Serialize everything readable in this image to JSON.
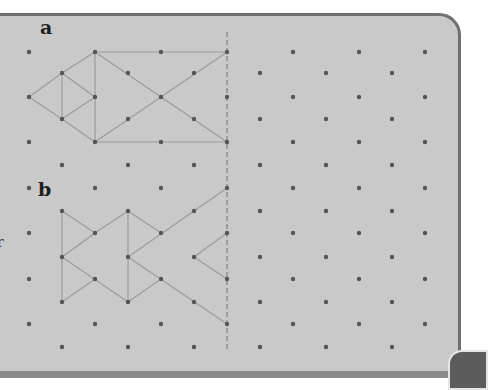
{
  "figure": {
    "type": "isometric dot grid with reflection line",
    "labels": {
      "a": "a",
      "b": "b"
    },
    "edge_fragment": "r",
    "colors": {
      "panel": "#c9c9c9",
      "border": "#707070",
      "dot": "#555555",
      "line": "#9c9c9c",
      "mirror": "#8a8a8a"
    },
    "grid": {
      "even_row_x": [
        29,
        95,
        161,
        227,
        293,
        359,
        425
      ],
      "odd_row_x": [
        62,
        128,
        194,
        260,
        326,
        392
      ],
      "even_row_y": [
        52,
        97,
        142,
        188,
        233,
        279,
        324
      ],
      "odd_row_y": [
        73,
        119,
        165,
        211,
        257,
        302,
        347
      ]
    },
    "mirror_line": {
      "x": 227,
      "y1": 32,
      "y2": 352,
      "style": "dashed"
    },
    "shape_a": {
      "segments": [
        [
          [
            95,
            52
          ],
          [
            227,
            52
          ]
        ],
        [
          [
            95,
            52
          ],
          [
            62,
            73
          ]
        ],
        [
          [
            62,
            73
          ],
          [
            29,
            97
          ]
        ],
        [
          [
            29,
            97
          ],
          [
            62,
            119
          ]
        ],
        [
          [
            62,
            119
          ],
          [
            95,
            142
          ]
        ],
        [
          [
            62,
            73
          ],
          [
            62,
            119
          ]
        ],
        [
          [
            62,
            73
          ],
          [
            95,
            97
          ]
        ],
        [
          [
            95,
            97
          ],
          [
            62,
            119
          ]
        ],
        [
          [
            95,
            52
          ],
          [
            95,
            142
          ]
        ],
        [
          [
            95,
            52
          ],
          [
            227,
            142
          ]
        ],
        [
          [
            95,
            142
          ],
          [
            227,
            52
          ]
        ],
        [
          [
            95,
            142
          ],
          [
            227,
            142
          ]
        ]
      ]
    },
    "shape_b": {
      "segments": [
        [
          [
            62,
            211
          ],
          [
            62,
            302
          ]
        ],
        [
          [
            62,
            211
          ],
          [
            95,
            233
          ]
        ],
        [
          [
            95,
            233
          ],
          [
            128,
            211
          ]
        ],
        [
          [
            95,
            233
          ],
          [
            62,
            257
          ]
        ],
        [
          [
            62,
            257
          ],
          [
            128,
            302
          ]
        ],
        [
          [
            95,
            279
          ],
          [
            62,
            302
          ]
        ],
        [
          [
            128,
            211
          ],
          [
            128,
            302
          ]
        ],
        [
          [
            128,
            211
          ],
          [
            161,
            233
          ]
        ],
        [
          [
            128,
            257
          ],
          [
            227,
            188
          ]
        ],
        [
          [
            128,
            257
          ],
          [
            227,
            324
          ]
        ],
        [
          [
            161,
            279
          ],
          [
            128,
            302
          ]
        ],
        [
          [
            194,
            257
          ],
          [
            227,
            233
          ]
        ],
        [
          [
            194,
            257
          ],
          [
            227,
            279
          ]
        ]
      ]
    }
  }
}
